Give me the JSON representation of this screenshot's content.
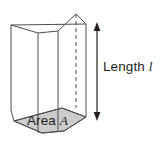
{
  "figure": {
    "type": "geometry-illustration",
    "shape": "pentagonal prism",
    "background_color": "#ffffff",
    "line_color": "#4d4d4d",
    "base_fill_color": "#cccccc",
    "face_fill_color": "#ffffff",
    "text_color": "#231f20"
  },
  "labels": {
    "length": {
      "text": "Length",
      "symbol": "l",
      "symbol_italic": true
    },
    "area": {
      "text": "Area",
      "symbol": "A",
      "symbol_italic": true
    }
  },
  "annotations": {
    "dimension_arrow": {
      "name": "length-dimension-arrow",
      "orientation": "vertical",
      "heads": "double",
      "color": "#231f20"
    },
    "hidden_edge": {
      "name": "hidden-back-edge",
      "style": "dashed",
      "color": "#4d4d4d"
    }
  },
  "geometry": {
    "top_face": "11,25 38,33 58,31 76,14 86,24",
    "bottom_face": "14,121 42,133 64,131 86,117 62,108",
    "left_vertical_edge": "11,25 11,110",
    "front_left_vertical_edge": "38,33 38,133",
    "front_mid_vertical_edge": "58,31 58,131",
    "right_vertical_edge": "86,24 86,117",
    "hidden_vertical_edge": "76,14 76,108",
    "arrow_x": 97,
    "arrow_top_y": 25,
    "arrow_bottom_y": 118
  }
}
